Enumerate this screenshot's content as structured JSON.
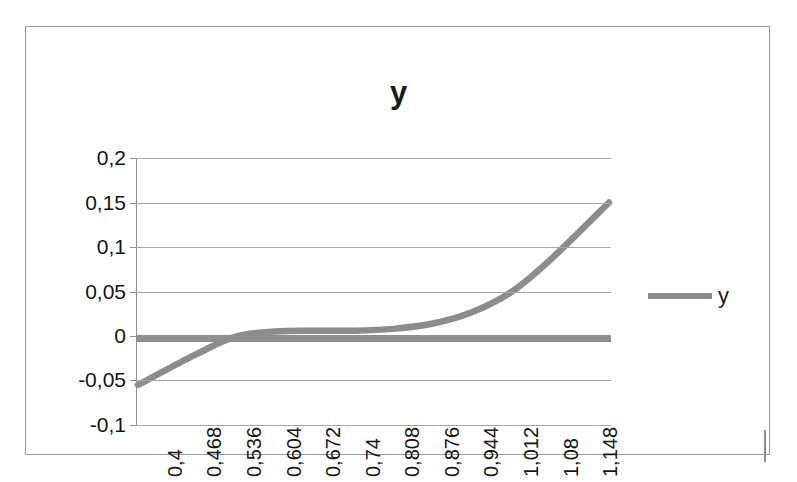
{
  "chart_data": {
    "type": "line",
    "title": "y",
    "xlabel": "",
    "ylabel": "",
    "grid": true,
    "legend_position": "right",
    "legend": [
      "y"
    ],
    "series_color": "#8c8c8c",
    "decimal_separator": ",",
    "x_tick_labels": [
      "0,4",
      "0,468",
      "0,536",
      "0,604",
      "0,672",
      "0,74",
      "0,808",
      "0,876",
      "0,944",
      "1,012",
      "1,08",
      "1,148"
    ],
    "x": [
      0.4,
      0.468,
      0.536,
      0.604,
      0.672,
      0.74,
      0.808,
      0.876,
      0.944,
      1.012,
      1.08,
      1.148
    ],
    "y_tick_labels": [
      "0,2",
      "0,15",
      "0,1",
      "0,05",
      "0",
      "-0,05",
      "-0,1"
    ],
    "y_ticks": [
      0.2,
      0.15,
      0.1,
      0.05,
      0,
      -0.05,
      -0.1
    ],
    "ylim": [
      -0.1,
      0.2
    ],
    "xlim": [
      0.4,
      1.148
    ],
    "series": [
      {
        "name": "y",
        "values": [
          -0.055,
          -0.021,
          -0.001,
          0.005,
          0.006,
          0.006,
          0.008,
          0.014,
          0.027,
          0.05,
          0.087,
          0.15
        ]
      }
    ]
  },
  "legend": {
    "entry_label": "y"
  },
  "title": {
    "text": "y"
  }
}
